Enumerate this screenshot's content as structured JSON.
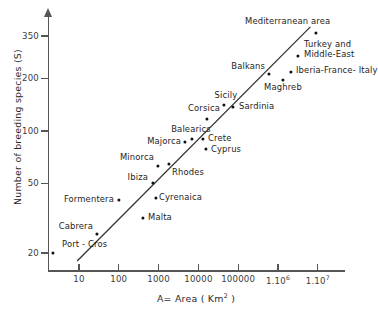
{
  "chart_data": {
    "type": "scatter",
    "title": "",
    "xlabel": "A= Area ( Km2 )",
    "xlabel_parts": {
      "pre": "A= Area ( Km",
      "sup": "2",
      "post": " )"
    },
    "ylabel": "Number of breeding species (S)",
    "x_scale": "log",
    "y_scale": "log",
    "xlim": [
      3,
      10000000
    ],
    "ylim": [
      17,
      400
    ],
    "grid": false,
    "legend": "none",
    "xticks": [
      {
        "value": 10,
        "label": "10"
      },
      {
        "value": 100,
        "label": "100"
      },
      {
        "value": 1000,
        "label": "1000"
      },
      {
        "value": 10000,
        "label": "10000"
      },
      {
        "value": 100000,
        "label": "100000"
      },
      {
        "value": 1000000,
        "label": "1.10",
        "sup": "6"
      },
      {
        "value": 10000000,
        "label": "1.10",
        "sup": "7"
      }
    ],
    "yticks": [
      {
        "value": 20,
        "label": "20"
      },
      {
        "value": 50,
        "label": "50"
      },
      {
        "value": 100,
        "label": "100"
      },
      {
        "value": 200,
        "label": "200"
      },
      {
        "value": 350,
        "label": "350"
      }
    ],
    "points": [
      {
        "name": "Port - Cros",
        "area": 7,
        "species": 20,
        "label_pos": "right-above"
      },
      {
        "name": "Cabrera",
        "area": 15,
        "species": 26,
        "label_pos": "left-above"
      },
      {
        "name": "Formentera",
        "area": 85,
        "species": 40,
        "label_pos": "left"
      },
      {
        "name": "Malta",
        "area": 320,
        "species": 30,
        "label_pos": "right"
      },
      {
        "name": "Ibiza",
        "area": 570,
        "species": 50,
        "label_pos": "left"
      },
      {
        "name": "Minorca",
        "area": 700,
        "species": 65,
        "label_pos": "left-above"
      },
      {
        "name": "Rhodes",
        "area": 1400,
        "species": 67,
        "label_pos": "below"
      },
      {
        "name": "Cyrenaica",
        "area": 2300,
        "species": 55,
        "label_pos": "right"
      },
      {
        "name": "Majorca",
        "area": 3600,
        "species": 88,
        "label_pos": "left"
      },
      {
        "name": "Balearics",
        "area": 5000,
        "species": 95,
        "label_pos": "above"
      },
      {
        "name": "Crete",
        "area": 8300,
        "species": 90,
        "label_pos": "right"
      },
      {
        "name": "Cyprus",
        "area": 9500,
        "species": 74,
        "label_pos": "right"
      },
      {
        "name": "Corsica",
        "area": 8700,
        "species": 123,
        "label_pos": "above-left"
      },
      {
        "name": "Sicily",
        "area": 25000,
        "species": 155,
        "label_pos": "above"
      },
      {
        "name": "Sardinia",
        "area": 34000,
        "species": 148,
        "label_pos": "right"
      },
      {
        "name": "Balkans",
        "area": 230000,
        "species": 205,
        "label_pos": "left-above"
      },
      {
        "name": "Maghreb",
        "area": 550000,
        "species": 196,
        "label_pos": "below"
      },
      {
        "name": "Iberia-France- Italy",
        "area": 900000,
        "species": 212,
        "label_pos": "right"
      },
      {
        "name": "Turkey and Middle-East",
        "area": 1500000,
        "species": 240,
        "label_pos": "right"
      },
      {
        "name": "Mediterranean area",
        "area": 4200000,
        "species": 345,
        "label_pos": "left-above"
      }
    ],
    "trend_line": {
      "label": "",
      "x_start": 9,
      "y_start": 18,
      "x_end": 6500000,
      "y_end": 395
    }
  }
}
